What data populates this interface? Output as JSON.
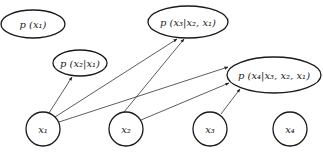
{
  "diagram": {
    "type": "bayesian-network-factorization",
    "colors": {
      "stroke": "#1a1a1a",
      "edge": "#333333",
      "text": "#222222",
      "background": "#ffffff"
    },
    "factor_nodes": [
      {
        "id": "f1",
        "text": "p (x₁)",
        "cx": 33,
        "cy": 24,
        "rx": 32,
        "ry": 14
      },
      {
        "id": "f2",
        "text": "p (x₂|x₁)",
        "cx": 80,
        "cy": 63,
        "rx": 27,
        "ry": 13
      },
      {
        "id": "f3",
        "text": "p (x₃|x₂, x₁)",
        "cx": 188,
        "cy": 22,
        "rx": 40,
        "ry": 16
      },
      {
        "id": "f4",
        "text": "p (x₄|x₃, x₂, x₁)",
        "cx": 274,
        "cy": 75,
        "rx": 47,
        "ry": 18
      }
    ],
    "variable_nodes": [
      {
        "id": "x1",
        "text": "x₁",
        "cx": 43,
        "cy": 129,
        "r": 17
      },
      {
        "id": "x2",
        "text": "x₂",
        "cx": 126,
        "cy": 129,
        "r": 17
      },
      {
        "id": "x3",
        "text": "x₃",
        "cx": 210,
        "cy": 129,
        "r": 17
      },
      {
        "id": "x4",
        "text": "x₄",
        "cx": 290,
        "cy": 129,
        "r": 17
      }
    ],
    "edges": [
      {
        "from": "x1",
        "to": "f2"
      },
      {
        "from": "x1",
        "to": "f3"
      },
      {
        "from": "x1",
        "to": "f4"
      },
      {
        "from": "x2",
        "to": "f3"
      },
      {
        "from": "x2",
        "to": "f4"
      },
      {
        "from": "x3",
        "to": "f4"
      }
    ]
  }
}
